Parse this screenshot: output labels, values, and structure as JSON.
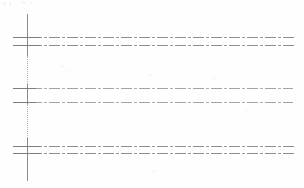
{
  "figure": {
    "kind": "scanned-grid-diagram",
    "background_color": "#fefefe",
    "width": 304,
    "height": 188,
    "axis_color": "#8d8d8f",
    "gridline_color": "#8f8f91",
    "gridline_style": "dash-dot",
    "caption": ""
  },
  "chart_data": {
    "type": "line",
    "title": "",
    "subtitle": "",
    "xlabel": "",
    "ylabel": "",
    "grid": true,
    "legend": "none",
    "xlim": [
      0,
      304
    ],
    "ylim": [
      0,
      188
    ],
    "tick_labels": {
      "x": [],
      "y": []
    },
    "annotations": [],
    "axes": [
      {
        "name": "vertical-axis",
        "orientation": "vertical",
        "x": 27,
        "y_start": 14,
        "y_end": 181,
        "style": "solid-with-dotted-gaps",
        "color": "#8d8d8f",
        "dotted_segments": [
          {
            "y_start": 56,
            "y_end": 84
          },
          {
            "y_start": 104,
            "y_end": 138
          }
        ]
      }
    ],
    "series": [
      {
        "name": "gridline-1",
        "group": "pair-1",
        "y": 37,
        "x_start": 13,
        "x_end": 296,
        "style": "dash-dot",
        "weight": "medium",
        "color": "#8e8e90"
      },
      {
        "name": "gridline-2",
        "group": "pair-1",
        "y": 45,
        "x_start": 13,
        "x_end": 294,
        "style": "dash-dot",
        "weight": "medium",
        "color": "#8e8e90"
      },
      {
        "name": "gridline-3",
        "group": "pair-2",
        "y": 88,
        "x_start": 13,
        "x_end": 293,
        "style": "dash-dot",
        "weight": "light",
        "color": "#a3a3a5"
      },
      {
        "name": "gridline-4",
        "group": "pair-2",
        "y": 102,
        "x_start": 13,
        "x_end": 293,
        "style": "dash-dot",
        "weight": "light",
        "color": "#a3a3a5"
      },
      {
        "name": "gridline-5",
        "group": "pair-3",
        "y": 146,
        "x_start": 13,
        "x_end": 296,
        "style": "dash-dot",
        "weight": "medium",
        "color": "#8e8e90"
      },
      {
        "name": "gridline-6",
        "group": "pair-3",
        "y": 153,
        "x_start": 13,
        "x_end": 294,
        "style": "dash-dot",
        "weight": "medium",
        "color": "#8e8e90"
      }
    ],
    "ticks": [
      {
        "name": "tick-1",
        "y": 37,
        "x_start": 13,
        "x_end": 40
      },
      {
        "name": "tick-2",
        "y": 45,
        "x_start": 13,
        "x_end": 40
      },
      {
        "name": "tick-3",
        "y": 88,
        "x_start": 13,
        "x_end": 36
      },
      {
        "name": "tick-4",
        "y": 102,
        "x_start": 13,
        "x_end": 36
      },
      {
        "name": "tick-5",
        "y": 146,
        "x_start": 13,
        "x_end": 40
      },
      {
        "name": "tick-6",
        "y": 153,
        "x_start": 13,
        "x_end": 40
      }
    ],
    "speckles": [
      {
        "x": 3,
        "y": 2,
        "w": 3,
        "h": 3,
        "shade": "s1"
      },
      {
        "x": 9,
        "y": 2,
        "w": 2,
        "h": 3,
        "shade": "s1"
      },
      {
        "x": 22,
        "y": 1,
        "w": 4,
        "h": 3,
        "shade": "s2"
      },
      {
        "x": 30,
        "y": 2,
        "w": 3,
        "h": 2,
        "shade": "s2"
      },
      {
        "x": 60,
        "y": 65,
        "w": 4,
        "h": 3,
        "shade": "s3"
      },
      {
        "x": 68,
        "y": 69,
        "w": 3,
        "h": 2,
        "shade": "s3"
      },
      {
        "x": 148,
        "y": 74,
        "w": 5,
        "h": 2,
        "shade": "s3"
      },
      {
        "x": 213,
        "y": 77,
        "w": 4,
        "h": 2,
        "shade": "s3"
      },
      {
        "x": 152,
        "y": 170,
        "w": 4,
        "h": 3,
        "shade": "s3"
      },
      {
        "x": 246,
        "y": 110,
        "w": 3,
        "h": 2,
        "shade": "s3"
      }
    ]
  }
}
